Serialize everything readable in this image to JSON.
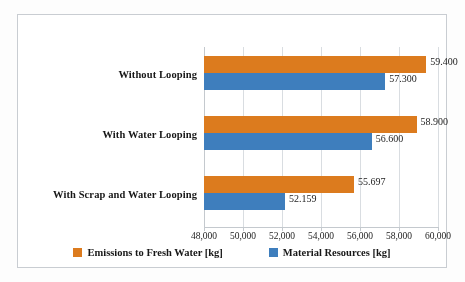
{
  "chart_data": {
    "type": "bar",
    "orientation": "horizontal",
    "title": "",
    "subtitle": "",
    "xlabel": "",
    "ylabel": "",
    "categories": [
      "Without Looping",
      "With Water Looping",
      "With Scrap and Water Looping"
    ],
    "series": [
      {
        "name": "Emissions to Fresh Water [kg]",
        "color": "#DF7B1B",
        "values": [
          59400,
          58900,
          55697
        ],
        "value_labels": [
          "59.400",
          "58.900",
          "55.697"
        ]
      },
      {
        "name": "Material Resources [kg]",
        "color": "#3C7EBF",
        "values": [
          57300,
          56600,
          52159
        ],
        "value_labels": [
          "57.300",
          "56.600",
          "52.159"
        ]
      }
    ],
    "xlim": [
      48000,
      60000
    ],
    "xticks": [
      48000,
      50000,
      52000,
      54000,
      56000,
      58000,
      60000
    ],
    "xtick_labels": [
      "48,000",
      "50,000",
      "52,000",
      "54,000",
      "56,000",
      "58,000",
      "60,000"
    ],
    "grid": true,
    "grid_axis": "x",
    "legend_position": "bottom",
    "data_labels": true
  },
  "legend": {
    "items": [
      {
        "label": "Emissions to Fresh Water [kg]",
        "color": "#DF7B1B"
      },
      {
        "label": "Material Resources [kg]",
        "color": "#3C7EBF"
      }
    ]
  }
}
